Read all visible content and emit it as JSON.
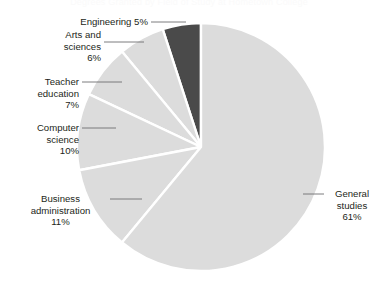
{
  "chart_data": {
    "type": "pie",
    "title": "Degrees Granted by Field of Study at Hometown College",
    "xlabel": "",
    "ylabel": "",
    "legend_position": "none",
    "grid": false,
    "unit": "%",
    "center": {
      "x": 201,
      "y": 147
    },
    "radius": 124,
    "start_angle_deg": 90,
    "direction": "counterclockwise",
    "separator_color": "#ffffff",
    "categories": [
      "Engineering",
      "Arts and sciences",
      "Teacher education",
      "Computer science",
      "Business administration",
      "General studies"
    ],
    "values": [
      5,
      6,
      7,
      10,
      11,
      61
    ],
    "colors": [
      "#4a4a4a",
      "#dcdcdc",
      "#dcdcdc",
      "#dcdcdc",
      "#dcdcdc",
      "#dcdcdc"
    ],
    "slices": [
      {
        "label": "Engineering",
        "value": 5,
        "value_text": "5%",
        "color": "#4a4a4a",
        "callout_text": "Engineering 5%",
        "callout_x": 70,
        "callout_y": 16,
        "callout_width": 78,
        "callout_align": "right",
        "leader": {
          "x1": 151,
          "y1": 22,
          "x2": 186,
          "y2": 22
        }
      },
      {
        "label": "Arts and sciences",
        "value": 6,
        "value_text": "6%",
        "color": "#dcdcdc",
        "callout_text": "Arts and\nsciences\n6%",
        "callout_x": 28,
        "callout_y": 29,
        "callout_width": 73,
        "callout_align": "right",
        "leader": {
          "x1": 104,
          "y1": 42,
          "x2": 144,
          "y2": 42
        }
      },
      {
        "label": "Teacher education",
        "value": 7,
        "value_text": "7%",
        "color": "#dcdcdc",
        "callout_text": "Teacher\neducation\n7%",
        "callout_x": 6,
        "callout_y": 76,
        "callout_width": 73,
        "callout_align": "right",
        "leader": {
          "x1": 82,
          "y1": 82,
          "x2": 122,
          "y2": 82
        }
      },
      {
        "label": "Computer science",
        "value": 10,
        "value_text": "10%",
        "color": "#dcdcdc",
        "callout_text": "Computer\nscience\n10%",
        "callout_x": 6,
        "callout_y": 122,
        "callout_width": 73,
        "callout_align": "right",
        "leader": {
          "x1": 82,
          "y1": 128,
          "x2": 116,
          "y2": 128
        }
      },
      {
        "label": "Business administration",
        "value": 11,
        "value_text": "11%",
        "color": "#dcdcdc",
        "callout_text": "Business\nadministration\n11%",
        "callout_x": 14,
        "callout_y": 193,
        "callout_width": 93,
        "callout_align": "center",
        "leader": {
          "x1": 110,
          "y1": 199,
          "x2": 142,
          "y2": 199
        }
      },
      {
        "label": "General studies",
        "value": 61,
        "value_text": "61%",
        "color": "#dcdcdc",
        "callout_text": "General\nstudies\n61%",
        "callout_x": 327,
        "callout_y": 188,
        "callout_width": 50,
        "callout_align": "center",
        "leader": {
          "x1": 303,
          "y1": 194,
          "x2": 324,
          "y2": 194
        }
      }
    ]
  },
  "colors": {
    "background": "#ffffff",
    "slice_light": "#dcdcdc",
    "slice_dark": "#4a4a4a",
    "separator": "#ffffff",
    "text": "#231f20",
    "leader_line": "#6d6e71"
  }
}
